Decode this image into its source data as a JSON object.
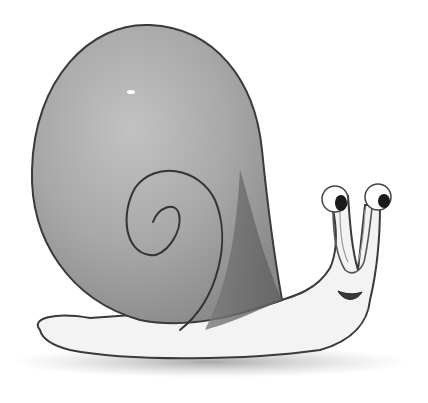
{
  "image": {
    "subject": "Watercolor illustration of a smiling snail",
    "style": "grayscale watercolor with pencil outlines",
    "elements": [
      "shell",
      "spiral",
      "body",
      "eye-stalks",
      "eyes",
      "mouth",
      "ground-shadow"
    ],
    "colors": {
      "background": "#ffffff",
      "shell_light": "#b4b4b4",
      "shell_mid": "#9a9a9a",
      "shell_dark": "#6e6e6e",
      "body": "#f2f2f2",
      "outline": "#3a3a3a",
      "shadow": "#8c8c8c",
      "pupil": "#1a1a1a"
    }
  }
}
